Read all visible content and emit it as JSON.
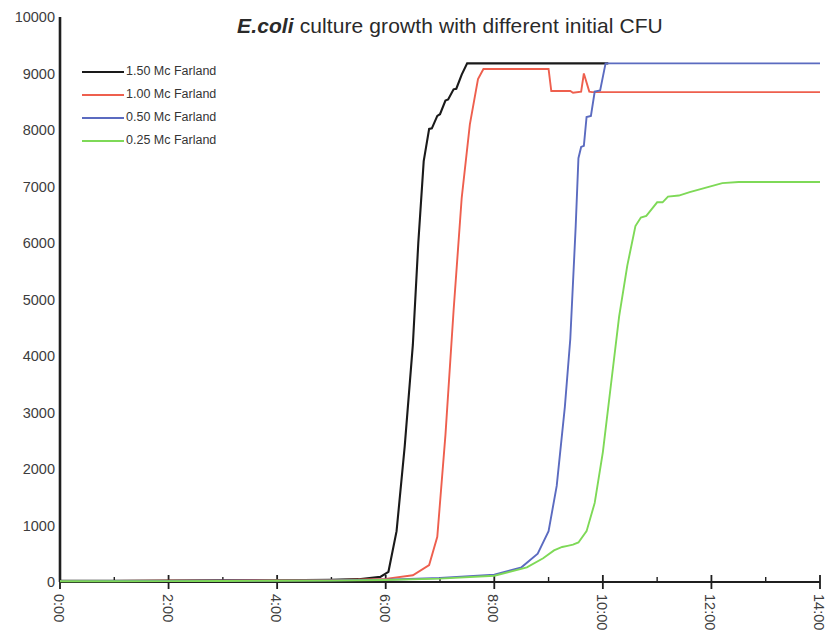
{
  "chart_data": {
    "type": "line",
    "title": "E.coli culture growth with different initial CFU",
    "title_emphasis": "E.coli",
    "title_rest": " culture growth with different initial CFU",
    "xlabel": "",
    "ylabel": "",
    "grid": false,
    "legend_position": "top-left inside plot",
    "xlim": [
      0,
      14
    ],
    "ylim": [
      0,
      10000
    ],
    "x_tick_labels": [
      "0:00",
      "2:00",
      "4:00",
      "6:00",
      "8:00",
      "10:00",
      "12:00",
      "14:00"
    ],
    "x_tick_values": [
      0,
      2,
      4,
      6,
      8,
      10,
      12,
      14
    ],
    "x_minor_tick_values": [
      1,
      3,
      5,
      7,
      9,
      11,
      13
    ],
    "y_tick_labels": [
      "0",
      "1000",
      "2000",
      "3000",
      "4000",
      "5000",
      "6000",
      "7000",
      "8000",
      "9000",
      "10000"
    ],
    "y_tick_values": [
      0,
      1000,
      2000,
      3000,
      4000,
      5000,
      6000,
      7000,
      8000,
      9000,
      10000
    ],
    "series": [
      {
        "name": "1.50 Mc Farland",
        "color": "#1a1a1a",
        "x": [
          0,
          1,
          2,
          3,
          4,
          5,
          5.5,
          5.9,
          6.05,
          6.2,
          6.35,
          6.5,
          6.6,
          6.7,
          6.8,
          6.85,
          6.95,
          7.0,
          7.1,
          7.15,
          7.25,
          7.3,
          7.4,
          7.5,
          8,
          9,
          10,
          10.1
        ],
        "values": [
          20,
          22,
          25,
          28,
          32,
          38,
          50,
          90,
          180,
          900,
          2400,
          4200,
          6000,
          7450,
          8020,
          8030,
          8250,
          8280,
          8520,
          8540,
          8720,
          8730,
          8980,
          9180,
          9180,
          9180,
          9180,
          9180
        ]
      },
      {
        "name": "1.00 Mc Farland",
        "color": "#ee5f4e",
        "x": [
          0,
          1,
          2,
          3,
          4,
          5,
          6,
          6.5,
          6.8,
          6.95,
          7.1,
          7.25,
          7.4,
          7.55,
          7.7,
          7.8,
          8.0,
          8.5,
          9.0,
          9.05,
          9.4,
          9.45,
          9.6,
          9.65,
          9.75,
          9.8,
          10,
          11,
          12,
          13,
          14
        ],
        "values": [
          18,
          20,
          22,
          25,
          28,
          34,
          55,
          120,
          300,
          800,
          2600,
          4800,
          6800,
          8100,
          8900,
          9080,
          9080,
          9080,
          9080,
          8690,
          8690,
          8660,
          8680,
          9000,
          8680,
          8670,
          8670,
          8670,
          8670,
          8670,
          8670
        ]
      },
      {
        "name": "0.50 Mc Farland",
        "color": "#5b6bc0",
        "x": [
          0,
          1,
          2,
          3,
          4,
          5,
          6,
          7,
          8,
          8.5,
          8.8,
          9.0,
          9.15,
          9.3,
          9.4,
          9.5,
          9.55,
          9.6,
          9.65,
          9.7,
          9.78,
          9.85,
          9.95,
          10.05,
          10.15,
          11,
          12,
          13,
          14
        ],
        "values": [
          15,
          17,
          19,
          21,
          24,
          28,
          40,
          70,
          130,
          260,
          500,
          900,
          1700,
          3100,
          4300,
          6300,
          7500,
          7700,
          7720,
          8230,
          8250,
          8680,
          8700,
          9180,
          9180,
          9180,
          9180,
          9180,
          9180
        ]
      },
      {
        "name": "0.25 Mc Farland",
        "color": "#7ed957",
        "x": [
          0,
          1,
          2,
          3,
          4,
          5,
          6,
          7,
          8,
          8.6,
          8.9,
          9.1,
          9.25,
          9.35,
          9.45,
          9.55,
          9.7,
          9.85,
          10.0,
          10.15,
          10.3,
          10.45,
          10.6,
          10.7,
          10.8,
          10.9,
          11.0,
          11.1,
          11.2,
          11.4,
          11.6,
          11.9,
          12.2,
          12.5,
          13,
          14
        ],
        "values": [
          12,
          14,
          16,
          18,
          21,
          25,
          35,
          60,
          110,
          260,
          420,
          560,
          620,
          640,
          660,
          700,
          900,
          1400,
          2300,
          3500,
          4700,
          5600,
          6300,
          6450,
          6480,
          6600,
          6720,
          6720,
          6820,
          6840,
          6900,
          6980,
          7060,
          7080,
          7080,
          7080
        ]
      }
    ]
  },
  "legend": {
    "items": [
      {
        "label": "1.50 Mc Farland",
        "color": "#1a1a1a"
      },
      {
        "label": "1.00 Mc Farland",
        "color": "#ee5f4e"
      },
      {
        "label": "0.50 Mc Farland",
        "color": "#5b6bc0"
      },
      {
        "label": "0.25 Mc Farland",
        "color": "#7ed957"
      }
    ]
  },
  "axes": {
    "axis_color": "#1f1f1f"
  }
}
